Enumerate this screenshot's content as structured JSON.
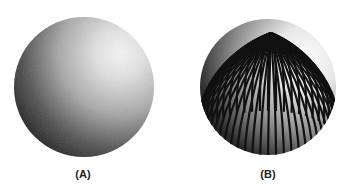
{
  "figures": [
    {
      "id": "A",
      "label": "(A)",
      "description": "smoothly shaded sphere",
      "center": [
        84,
        87
      ],
      "radius": 70,
      "highlight": [
        120,
        53
      ]
    },
    {
      "id": "B",
      "label": "(B)",
      "description": "sphere shaded with meridian stripes",
      "center": [
        268,
        87
      ],
      "radius": 68,
      "pole": [
        271,
        33
      ]
    }
  ],
  "colors": {
    "background": "#ffffff",
    "dark": "#111111",
    "light": "#f4f4f4",
    "label": "#222222"
  }
}
